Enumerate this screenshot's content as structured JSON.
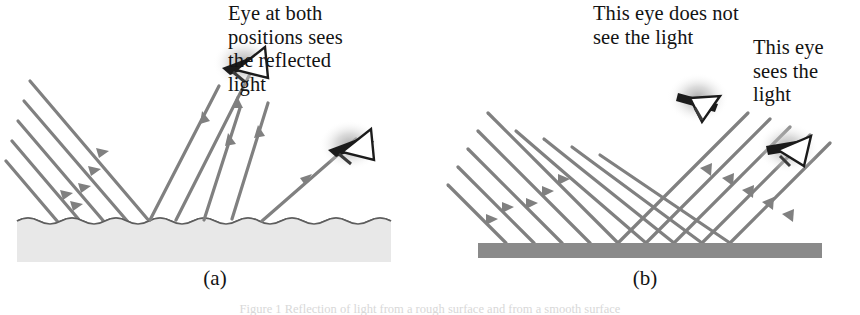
{
  "figure": {
    "background_color": "#ffffff",
    "ray_color": "#808080",
    "rough_surface_color": "#e8e8e8",
    "smooth_surface_color": "#8a8a8a",
    "surface_outline_color": "#555555",
    "eye_color": "#1b1b1b",
    "eye_glow_color": "#b8b8b8"
  },
  "panels": [
    {
      "id": "a",
      "label": "(a)",
      "surface_type": "rough-wavy-surface",
      "reflection_type": "diffuse",
      "callouts": [
        {
          "id": "callout-a",
          "text": "Eye at both\npositions sees\nthe reflected\nlight"
        }
      ],
      "eyes": [
        {
          "name": "eye-upper-left",
          "sees_light": true
        },
        {
          "name": "eye-lower-right",
          "sees_light": true
        }
      ],
      "incoming_rays": 5,
      "reflected_rays": 5
    },
    {
      "id": "b",
      "label": "(b)",
      "surface_type": "smooth-flat-surface",
      "reflection_type": "specular",
      "callouts": [
        {
          "id": "callout-b1",
          "text": "This eye does not\nsee the light"
        },
        {
          "id": "callout-b2",
          "text": "This eye\nsees the\nlight"
        }
      ],
      "eyes": [
        {
          "name": "eye-off-axis",
          "sees_light": false
        },
        {
          "name": "eye-on-axis",
          "sees_light": true
        }
      ],
      "incoming_rays": 5,
      "reflected_rays": 5
    }
  ],
  "page_caption": "Figure 1  Reflection of light from a rough surface and from a smooth surface"
}
